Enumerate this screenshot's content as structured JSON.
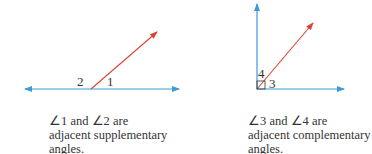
{
  "colors": {
    "line": "#3b9bd6",
    "ray": "#d94436",
    "text": "#333333"
  },
  "figures": [
    {
      "name": "supplementary",
      "angle_labels": [
        "2",
        "1"
      ],
      "caption": [
        "∠1 and ∠2 are",
        "adjacent supplementary",
        "angles."
      ]
    },
    {
      "name": "complementary",
      "angle_labels": [
        "4",
        "3"
      ],
      "caption": [
        "∠3 and ∠4 are",
        "adjacent complementary",
        "angles."
      ]
    }
  ]
}
